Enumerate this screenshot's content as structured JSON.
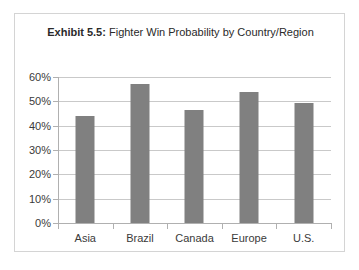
{
  "figure": {
    "title_strong": "Exhibit 5.5:",
    "title_rest": " Fighter Win Probability by Country/Region"
  },
  "colors": {
    "bar_fill": "#808080",
    "gridline": "#c9c9c9",
    "axis": "#b0b0b0",
    "frame_border": "#d4d4d4",
    "text": "#3a3a3a",
    "background": "#ffffff"
  },
  "chart_data": {
    "type": "bar",
    "title": "Exhibit 5.5: Fighter Win Probability by Country/Region",
    "categories": [
      "Asia",
      "Brazil",
      "Canada",
      "Europe",
      "U.S."
    ],
    "values": [
      0.44,
      0.57,
      0.465,
      0.54,
      0.495
    ],
    "value_labels": [
      "44%",
      "57%",
      "46.5%",
      "54%",
      "49.5%"
    ],
    "xlabel": "",
    "ylabel": "",
    "ylim": [
      0,
      0.6
    ],
    "ytick_values": [
      0,
      0.1,
      0.2,
      0.3,
      0.4,
      0.5,
      0.6
    ],
    "ytick_labels": [
      "0%",
      "10%",
      "20%",
      "30%",
      "40%",
      "50%",
      "60%"
    ],
    "grid": true,
    "grid_axis": "y",
    "legend": false,
    "legend_position": "none",
    "series": [
      {
        "name": "Fighter Win Probability",
        "values": [
          0.44,
          0.57,
          0.465,
          0.54,
          0.495
        ]
      }
    ]
  }
}
